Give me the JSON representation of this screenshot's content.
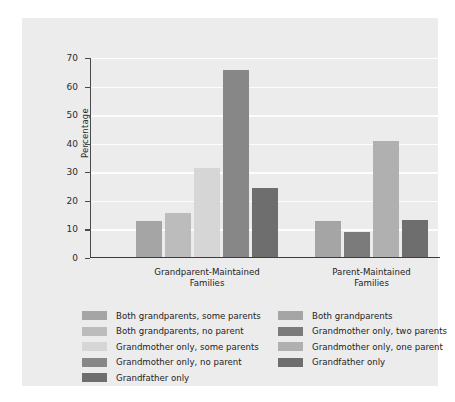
{
  "chart_data": {
    "type": "bar",
    "title": "",
    "subtitle": "",
    "xlabel": "",
    "ylabel": "Percentage",
    "ylim": [
      0,
      70
    ],
    "yticks": [
      0,
      10,
      20,
      30,
      40,
      50,
      60,
      70
    ],
    "ytick_labels": [
      "0",
      "10",
      "20",
      "30",
      "40",
      "50",
      "60",
      "70"
    ],
    "grid": true,
    "grid_axis": "y",
    "legend_position": "below-plot",
    "legend_columns": 2,
    "categories": [
      "Grandparent-Maintained\nFamilies",
      "Parent-Maintained\nFamilies"
    ],
    "groups": [
      {
        "category": "Grandparent-Maintained Families",
        "bars": [
          {
            "label": "Both grandparents, some parents",
            "value": 12.3,
            "color": "#a5a5a5"
          },
          {
            "label": "Both grandparents, no parent",
            "value": 15.4,
            "color": "#bcbcbc"
          },
          {
            "label": "Grandmother only, some parents",
            "value": 31.0,
            "color": "#d6d6d6"
          },
          {
            "label": "Grandmother only, no parent",
            "value": 65.2,
            "color": "#878787"
          },
          {
            "label": "Grandfather only",
            "value": 24.0,
            "color": "#6e6e6e"
          }
        ]
      },
      {
        "category": "Parent-Maintained Families",
        "bars": [
          {
            "label": "Both grandparents",
            "value": 12.6,
            "color": "#a5a5a5"
          },
          {
            "label": "Grandmother only, two parents",
            "value": 8.5,
            "color": "#7b7b7b"
          },
          {
            "label": "Grandmother only, one parent",
            "value": 40.6,
            "color": "#b0b0b0"
          },
          {
            "label": "Grandfather only",
            "value": 12.8,
            "color": "#6e6e6e"
          }
        ]
      }
    ],
    "legend": {
      "left_column": [
        {
          "label": "Both grandparents, some parents",
          "color": "#a5a5a5"
        },
        {
          "label": "Both grandparents, no parent",
          "color": "#bcbcbc"
        },
        {
          "label": "Grandmother only, some parents",
          "color": "#d6d6d6"
        },
        {
          "label": "Grandmother only, no parent",
          "color": "#878787"
        },
        {
          "label": "Grandfather only",
          "color": "#6e6e6e"
        }
      ],
      "right_column": [
        {
          "label": "Both grandparents",
          "color": "#a5a5a5"
        },
        {
          "label": "Grandmother only, two parents",
          "color": "#7b7b7b"
        },
        {
          "label": "Grandmother only, one parent",
          "color": "#b0b0b0"
        },
        {
          "label": "Grandfather only",
          "color": "#6e6e6e"
        }
      ]
    },
    "colors": {
      "panel_background": "#ececed",
      "figure_background": "#ffffff",
      "gridline": "#fdfdfd",
      "axis": "#4a4a4a",
      "text": "#232323"
    }
  }
}
